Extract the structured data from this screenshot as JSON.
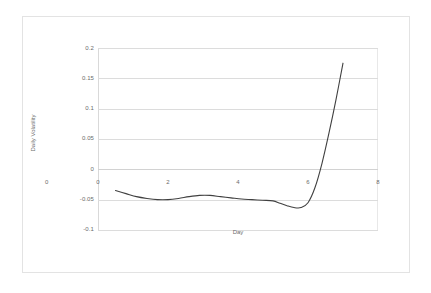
{
  "chart_data": {
    "type": "line",
    "title": "",
    "xlabel": "Day",
    "ylabel": "Daily Volatility",
    "xlim": [
      0,
      8
    ],
    "ylim": [
      -0.1,
      0.2
    ],
    "grid": true,
    "legend": "none",
    "line_color": "#404040",
    "gridline_color": "#dcdcdc",
    "frame_color": "#e3e3e3",
    "xticks": [
      "0",
      "2",
      "4",
      "6",
      "8"
    ],
    "xtick_values": [
      0,
      2,
      4,
      6,
      8
    ],
    "yticks": [
      "0.2",
      "0.15",
      "0.1",
      "0.05",
      "0",
      "-0.05",
      "-0.1"
    ],
    "ytick_values": [
      0.2,
      0.15,
      0.1,
      0.05,
      0,
      -0.05,
      -0.1
    ],
    "series": [
      {
        "name": "Daily Volatility",
        "x": [
          0.5,
          0.8,
          1.1,
          1.4,
          1.7,
          2.0,
          2.3,
          2.6,
          2.9,
          3.2,
          3.5,
          3.8,
          4.1,
          4.4,
          4.7,
          5.0,
          5.2,
          5.4,
          5.6,
          5.8,
          6.0,
          6.2,
          6.4,
          6.6,
          6.8,
          7.0
        ],
        "y": [
          -0.035,
          -0.04,
          -0.045,
          -0.048,
          -0.05,
          -0.05,
          -0.048,
          -0.045,
          -0.043,
          -0.043,
          -0.045,
          -0.047,
          -0.049,
          -0.05,
          -0.051,
          -0.052,
          -0.056,
          -0.06,
          -0.063,
          -0.063,
          -0.055,
          -0.03,
          0.01,
          0.06,
          0.115,
          0.175
        ]
      }
    ]
  },
  "axes": {
    "x_origin_label": "0"
  }
}
